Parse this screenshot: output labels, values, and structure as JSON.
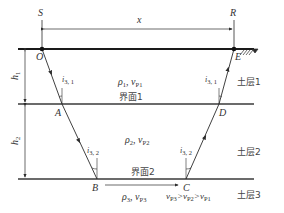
{
  "diagram": {
    "type": "seismic refraction ray path across layered soil",
    "points": {
      "S": "S",
      "R": "R",
      "O": "O",
      "E": "E",
      "A": "A",
      "D": "D",
      "B": "B",
      "C": "C"
    },
    "distance_label": "x",
    "thickness_labels": {
      "h1": "h",
      "h1_sub": "1",
      "h2": "h",
      "h2_sub": "2"
    },
    "angles": {
      "left_upper": {
        "main": "i",
        "sub": "3, 1"
      },
      "right_upper": {
        "main": "i",
        "sub": "3, 1"
      },
      "left_lower": {
        "main": "i",
        "sub": "3, 2"
      },
      "right_lower": {
        "main": "i",
        "sub": "3, 2"
      }
    },
    "layers": [
      {
        "name": "土层1",
        "rho": "ρ",
        "rho_sub": "1",
        "v": "v",
        "v_sub": "P1"
      },
      {
        "name": "土层2",
        "rho": "ρ",
        "rho_sub": "2",
        "v": "v",
        "v_sub": "P2"
      },
      {
        "name": "土层3",
        "rho": "ρ",
        "rho_sub": "3",
        "v": "v",
        "v_sub": "P3"
      }
    ],
    "interfaces": [
      "界面1",
      "界面2"
    ],
    "velocity_relation": {
      "v3": "v",
      "v3s": "P3",
      "gt1": ">",
      "v2": "v",
      "v2s": "P2",
      "gt2": ">",
      "v1": "v",
      "v1s": "P1"
    },
    "colors": {
      "line": "#2b2b2b",
      "text": "#333333"
    }
  }
}
